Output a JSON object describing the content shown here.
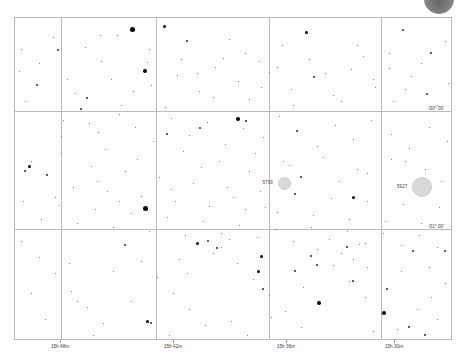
{
  "chart_data": {
    "type": "scatter",
    "xlabel": "Right Ascension",
    "ylabel": "Declination",
    "grid": true,
    "legend": "none",
    "projection": "equatorial",
    "x_axis": {
      "unit": "hours-minutes",
      "tick_labels": [
        "15h 48m",
        "15h 42m",
        "15h 36m",
        "15h 30m"
      ],
      "tick_positions_px": [
        60,
        173,
        286,
        394
      ],
      "direction": "decreasing-right"
    },
    "y_axis": {
      "unit": "degrees-arcminutes",
      "tick_labels": [
        "-50° 00'",
        "-51° 00'"
      ],
      "tick_positions_px": [
        110,
        228
      ]
    },
    "gridlines": {
      "vertical_px": [
        60,
        155,
        268,
        380
      ],
      "horizontal_px": [
        110,
        228
      ]
    },
    "deep_sky_objects": [
      {
        "label": "5799",
        "x": 283,
        "y": 182,
        "size": 13,
        "symbol": "open-cluster-disc"
      },
      {
        "label": "5927",
        "x": 421,
        "y": 186,
        "size": 20,
        "symbol": "globular-cluster-disc"
      }
    ],
    "stars": [
      [
        131,
        28,
        5
      ],
      [
        163,
        25,
        3
      ],
      [
        186,
        40,
        2
      ],
      [
        305,
        31,
        3
      ],
      [
        402,
        29,
        2
      ],
      [
        430,
        52,
        2
      ],
      [
        57,
        49,
        2
      ],
      [
        99,
        34,
        1
      ],
      [
        146,
        61,
        1
      ],
      [
        222,
        57,
        1
      ],
      [
        258,
        60,
        1
      ],
      [
        281,
        44,
        1
      ],
      [
        362,
        55,
        1
      ],
      [
        388,
        67,
        1
      ],
      [
        444,
        40,
        1
      ],
      [
        18,
        70,
        1
      ],
      [
        36,
        84,
        2
      ],
      [
        74,
        92,
        1
      ],
      [
        86,
        97,
        2
      ],
      [
        110,
        78,
        1
      ],
      [
        120,
        104,
        1
      ],
      [
        150,
        84,
        1
      ],
      [
        176,
        74,
        1
      ],
      [
        198,
        90,
        1
      ],
      [
        214,
        66,
        1
      ],
      [
        237,
        80,
        1
      ],
      [
        248,
        98,
        1
      ],
      [
        268,
        71,
        1
      ],
      [
        290,
        88,
        1
      ],
      [
        313,
        76,
        2
      ],
      [
        332,
        94,
        1
      ],
      [
        350,
        68,
        1
      ],
      [
        374,
        86,
        1
      ],
      [
        392,
        100,
        1
      ],
      [
        410,
        75,
        1
      ],
      [
        426,
        93,
        2
      ],
      [
        447,
        82,
        1
      ],
      [
        62,
        119,
        1
      ],
      [
        80,
        108,
        2
      ],
      [
        97,
        131,
        1
      ],
      [
        118,
        113,
        1
      ],
      [
        134,
        126,
        1
      ],
      [
        152,
        140,
        1
      ],
      [
        170,
        117,
        1
      ],
      [
        188,
        134,
        1
      ],
      [
        206,
        121,
        1
      ],
      [
        224,
        143,
        1
      ],
      [
        242,
        127,
        1
      ],
      [
        262,
        136,
        1
      ],
      [
        278,
        115,
        1
      ],
      [
        296,
        130,
        2
      ],
      [
        316,
        145,
        1
      ],
      [
        334,
        124,
        1
      ],
      [
        352,
        138,
        1
      ],
      [
        370,
        119,
        1
      ],
      [
        390,
        133,
        1
      ],
      [
        408,
        147,
        1
      ],
      [
        428,
        126,
        1
      ],
      [
        446,
        140,
        1
      ],
      [
        144,
        70,
        4
      ],
      [
        144,
        207,
        5
      ],
      [
        24,
        100,
        1
      ],
      [
        30,
        160,
        1
      ],
      [
        46,
        174,
        2
      ],
      [
        60,
        152,
        1
      ],
      [
        72,
        186,
        1
      ],
      [
        90,
        165,
        1
      ],
      [
        106,
        190,
        1
      ],
      [
        124,
        170,
        1
      ],
      [
        140,
        195,
        1
      ],
      [
        158,
        176,
        1
      ],
      [
        174,
        200,
        1
      ],
      [
        192,
        182,
        1
      ],
      [
        208,
        205,
        1
      ],
      [
        226,
        186,
        1
      ],
      [
        244,
        208,
        1
      ],
      [
        259,
        190,
        1
      ],
      [
        276,
        211,
        1
      ],
      [
        294,
        193,
        2
      ],
      [
        312,
        214,
        1
      ],
      [
        330,
        197,
        1
      ],
      [
        348,
        218,
        1
      ],
      [
        366,
        200,
        1
      ],
      [
        384,
        220,
        1
      ],
      [
        402,
        203,
        1
      ],
      [
        420,
        222,
        1
      ],
      [
        438,
        206,
        1
      ],
      [
        237,
        118,
        4
      ],
      [
        245,
        120,
        2
      ],
      [
        199,
        127,
        2
      ],
      [
        166,
        133,
        2
      ],
      [
        28,
        165,
        3
      ],
      [
        24,
        170,
        2
      ],
      [
        60,
        135,
        1
      ],
      [
        88,
        122,
        1
      ],
      [
        104,
        148,
        1
      ],
      [
        136,
        158,
        1
      ],
      [
        182,
        150,
        1
      ],
      [
        218,
        160,
        1
      ],
      [
        254,
        152,
        1
      ],
      [
        288,
        164,
        1
      ],
      [
        322,
        156,
        1
      ],
      [
        356,
        168,
        1
      ],
      [
        390,
        158,
        1
      ],
      [
        424,
        168,
        1
      ],
      [
        20,
        240,
        1
      ],
      [
        38,
        256,
        1
      ],
      [
        54,
        272,
        1
      ],
      [
        70,
        290,
        1
      ],
      [
        86,
        306,
        1
      ],
      [
        102,
        322,
        1
      ],
      [
        124,
        244,
        2
      ],
      [
        140,
        260,
        1
      ],
      [
        156,
        276,
        1
      ],
      [
        172,
        292,
        1
      ],
      [
        188,
        308,
        1
      ],
      [
        204,
        324,
        1
      ],
      [
        220,
        246,
        1
      ],
      [
        236,
        262,
        1
      ],
      [
        252,
        278,
        1
      ],
      [
        268,
        294,
        1
      ],
      [
        284,
        310,
        1
      ],
      [
        300,
        326,
        1
      ],
      [
        316,
        248,
        1
      ],
      [
        332,
        264,
        1
      ],
      [
        348,
        280,
        1
      ],
      [
        364,
        296,
        1
      ],
      [
        380,
        312,
        1
      ],
      [
        396,
        328,
        1
      ],
      [
        412,
        250,
        2
      ],
      [
        428,
        266,
        1
      ],
      [
        444,
        282,
        1
      ],
      [
        196,
        242,
        3
      ],
      [
        207,
        240,
        2
      ],
      [
        216,
        247,
        2
      ],
      [
        212,
        252,
        1
      ],
      [
        228,
        238,
        1
      ],
      [
        340,
        252,
        1
      ],
      [
        346,
        246,
        2
      ],
      [
        352,
        258,
        1
      ],
      [
        358,
        243,
        1
      ],
      [
        310,
        255,
        2
      ],
      [
        316,
        264,
        2
      ],
      [
        260,
        255,
        3
      ],
      [
        257,
        270,
        3
      ],
      [
        262,
        288,
        2
      ],
      [
        318,
        302,
        4
      ],
      [
        352,
        280,
        2
      ],
      [
        386,
        288,
        2
      ],
      [
        383,
        312,
        4
      ],
      [
        408,
        326,
        2
      ],
      [
        146,
        320,
        3
      ],
      [
        150,
        322,
        2
      ],
      [
        444,
        250,
        2
      ],
      [
        430,
        296,
        1
      ],
      [
        436,
        318,
        1
      ],
      [
        68,
        262,
        1
      ],
      [
        76,
        300,
        1
      ],
      [
        92,
        334,
        1
      ],
      [
        44,
        318,
        1
      ],
      [
        30,
        292,
        1
      ],
      [
        112,
        270,
        1
      ],
      [
        130,
        300,
        1
      ],
      [
        168,
        334,
        1
      ],
      [
        186,
        272,
        1
      ],
      [
        178,
        258,
        1
      ],
      [
        230,
        320,
        1
      ],
      [
        246,
        334,
        1
      ],
      [
        270,
        316,
        1
      ],
      [
        294,
        270,
        2
      ],
      [
        302,
        286,
        1
      ],
      [
        366,
        266,
        1
      ],
      [
        372,
        330,
        1
      ],
      [
        400,
        270,
        1
      ],
      [
        416,
        308,
        1
      ],
      [
        424,
        334,
        2
      ],
      [
        20,
        48,
        1
      ],
      [
        38,
        62,
        1
      ],
      [
        52,
        36,
        1
      ],
      [
        66,
        78,
        1
      ],
      [
        84,
        46,
        1
      ],
      [
        100,
        60,
        1
      ],
      [
        116,
        34,
        1
      ],
      [
        132,
        90,
        1
      ],
      [
        148,
        48,
        1
      ],
      [
        164,
        106,
        1
      ],
      [
        180,
        58,
        1
      ],
      [
        196,
        72,
        1
      ],
      [
        212,
        96,
        1
      ],
      [
        228,
        38,
        1
      ],
      [
        244,
        52,
        1
      ],
      [
        260,
        86,
        1
      ],
      [
        276,
        66,
        1
      ],
      [
        292,
        104,
        1
      ],
      [
        308,
        58,
        1
      ],
      [
        324,
        72,
        1
      ],
      [
        340,
        100,
        1
      ],
      [
        356,
        44,
        1
      ],
      [
        372,
        78,
        1
      ],
      [
        388,
        52,
        1
      ],
      [
        404,
        88,
        1
      ],
      [
        420,
        62,
        1
      ],
      [
        436,
        104,
        1
      ],
      [
        452,
        70,
        1
      ],
      [
        22,
        200,
        1
      ],
      [
        40,
        218,
        1
      ],
      [
        58,
        204,
        1
      ],
      [
        76,
        222,
        1
      ],
      [
        94,
        208,
        1
      ],
      [
        112,
        226,
        1
      ],
      [
        130,
        212,
        1
      ],
      [
        148,
        230,
        1
      ],
      [
        166,
        216,
        1
      ],
      [
        184,
        234,
        1
      ],
      [
        202,
        220,
        1
      ],
      [
        220,
        232,
        1
      ],
      [
        238,
        224,
        1
      ],
      [
        256,
        236,
        1
      ],
      [
        274,
        228,
        1
      ],
      [
        292,
        240,
        1
      ],
      [
        310,
        226,
        1
      ],
      [
        328,
        238,
        1
      ],
      [
        346,
        230,
        1
      ],
      [
        364,
        242,
        1
      ],
      [
        382,
        232,
        1
      ],
      [
        400,
        244,
        1
      ],
      [
        418,
        234,
        1
      ],
      [
        436,
        246,
        1
      ],
      [
        352,
        196,
        3
      ],
      [
        338,
        180,
        1
      ],
      [
        366,
        172,
        1
      ],
      [
        404,
        160,
        1
      ],
      [
        440,
        180,
        1
      ],
      [
        200,
        166,
        1
      ],
      [
        170,
        188,
        1
      ],
      [
        118,
        200,
        1
      ],
      [
        96,
        180,
        1
      ],
      [
        54,
        196,
        1
      ],
      [
        282,
        160,
        1
      ],
      [
        300,
        176,
        2
      ],
      [
        264,
        206,
        1
      ],
      [
        248,
        170,
        1
      ],
      [
        232,
        196,
        1
      ]
    ]
  },
  "corner_badge": {
    "name": "circular-overlay",
    "color": "#6e6e6e"
  },
  "frame": {
    "left": 14,
    "top": 17,
    "width": 438,
    "height": 323
  }
}
